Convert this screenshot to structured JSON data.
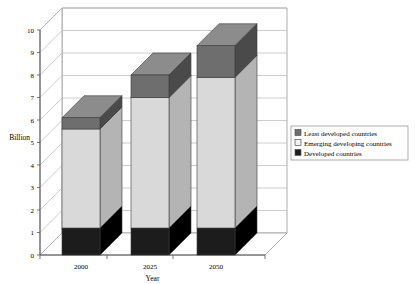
{
  "chart_data": {
    "type": "bar",
    "subtype": "stacked-3d-column",
    "title": "",
    "xlabel": "Year",
    "ylabel": "Billion",
    "categories": [
      "2000",
      "2025",
      "2050"
    ],
    "ylim": [
      0,
      10
    ],
    "ytick_labels": [
      "0",
      "1",
      "2",
      "3",
      "4",
      "5",
      "6",
      "7",
      "8",
      "9",
      "10"
    ],
    "ytick_values": [
      0,
      1,
      2,
      3,
      4,
      5,
      6,
      7,
      8,
      9,
      10
    ],
    "grid": true,
    "legend_position": "right",
    "series": [
      {
        "name": "Developed countries",
        "color": "#1c1c1c",
        "values": [
          1.2,
          1.2,
          1.2
        ]
      },
      {
        "name": "Emerging developing countries",
        "color": "#d9d9d9",
        "values": [
          4.4,
          5.8,
          6.7
        ]
      },
      {
        "name": "Least developed countries",
        "color": "#6e6e6e",
        "values": [
          0.5,
          1.0,
          1.4
        ]
      }
    ],
    "stack_tops": [
      6.1,
      8.0,
      9.3
    ],
    "annotations": []
  },
  "legend": {
    "items": [
      {
        "label": "Least developed countries",
        "swatch": "#6e6e6e"
      },
      {
        "label": "Emerging developing countries",
        "swatch": "#f2f2f2"
      },
      {
        "label": "Developed countries",
        "swatch": "#1c1c1c"
      }
    ]
  },
  "colors": {
    "plot_background": "#ffffff",
    "grid_line": "#b8b8b8",
    "axis_line": "#555555",
    "wall_line": "#9a9a9a",
    "legend_border": "#9a9a9a",
    "developed_front": "#1c1c1c",
    "developed_top": "#3a3a3a",
    "developed_side": "#000000",
    "emerging_front": "#d9d9d9",
    "emerging_top": "#efefef",
    "emerging_side": "#b4b4b4",
    "least_front": "#6e6e6e",
    "least_top": "#8c8c8c",
    "least_side": "#4a4a4a"
  }
}
